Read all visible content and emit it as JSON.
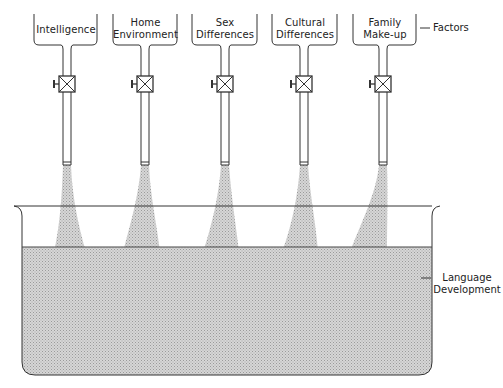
{
  "diagram": {
    "title": "",
    "factors_label": "Factors",
    "outcome_label_line1": "Language",
    "outcome_label_line2": "Development",
    "fill_color": "#c8c8c8",
    "line_color": "#333333",
    "funnels": [
      {
        "id": "intelligence",
        "line1": "Intelligence",
        "line2": "",
        "cx": 67
      },
      {
        "id": "home-environment",
        "line1": "Home",
        "line2": "Environment",
        "cx": 145
      },
      {
        "id": "sex-differences",
        "line1": "Sex",
        "line2": "Differences",
        "cx": 225
      },
      {
        "id": "cultural-differences",
        "line1": "Cultural",
        "line2": "Differences",
        "cx": 304
      },
      {
        "id": "family-make-up",
        "line1": "Family",
        "line2": "Make-up",
        "cx": 383
      }
    ]
  }
}
